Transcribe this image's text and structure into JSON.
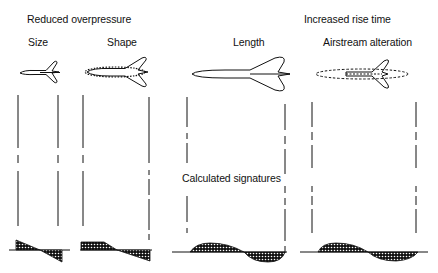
{
  "headers": {
    "reduced_overpressure": "Reduced overpressure",
    "increased_rise_time": "Increased rise time"
  },
  "columns": [
    {
      "label": "Size",
      "signature": "n-wave"
    },
    {
      "label": "Shape",
      "signature": "flat-top"
    },
    {
      "label": "Length",
      "signature": "smooth-sine"
    },
    {
      "label": "Airstream alteration",
      "signature": "smooth-sine"
    }
  ],
  "center_label": "Calculated signatures",
  "colors": {
    "ink": "#111111",
    "background": "#ffffff"
  }
}
